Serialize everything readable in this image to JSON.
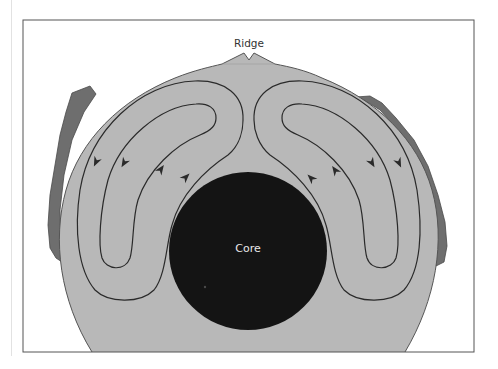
{
  "diagram": {
    "type": "cross-section",
    "labels": {
      "ridge": "Ridge",
      "core": "Core"
    },
    "colors": {
      "frame": "#555555",
      "mantle": "#b8b8b8",
      "crust": "#6e6e6e",
      "core": "#141414",
      "flow_lines": "#2a2a2a",
      "background": "#ffffff",
      "core_label": "#e8e8e8"
    },
    "convection_cells": [
      {
        "side": "left",
        "loops": 2,
        "outer_flow": "downward",
        "inner_flow": "upward"
      },
      {
        "side": "right",
        "loops": 2,
        "outer_flow": "downward",
        "inner_flow": "upward"
      }
    ],
    "arrows": [
      {
        "side": "left",
        "direction": "down",
        "x": 96,
        "y": 162
      },
      {
        "side": "left",
        "direction": "down",
        "x": 124,
        "y": 163
      },
      {
        "side": "left",
        "direction": "up",
        "x": 161,
        "y": 169
      },
      {
        "side": "left",
        "direction": "up",
        "x": 186,
        "y": 177
      },
      {
        "side": "right",
        "direction": "up",
        "x": 311,
        "y": 178
      },
      {
        "side": "right",
        "direction": "up",
        "x": 335,
        "y": 170
      },
      {
        "side": "right",
        "direction": "down",
        "x": 372,
        "y": 163
      },
      {
        "side": "right",
        "direction": "down",
        "x": 399,
        "y": 163
      }
    ]
  }
}
